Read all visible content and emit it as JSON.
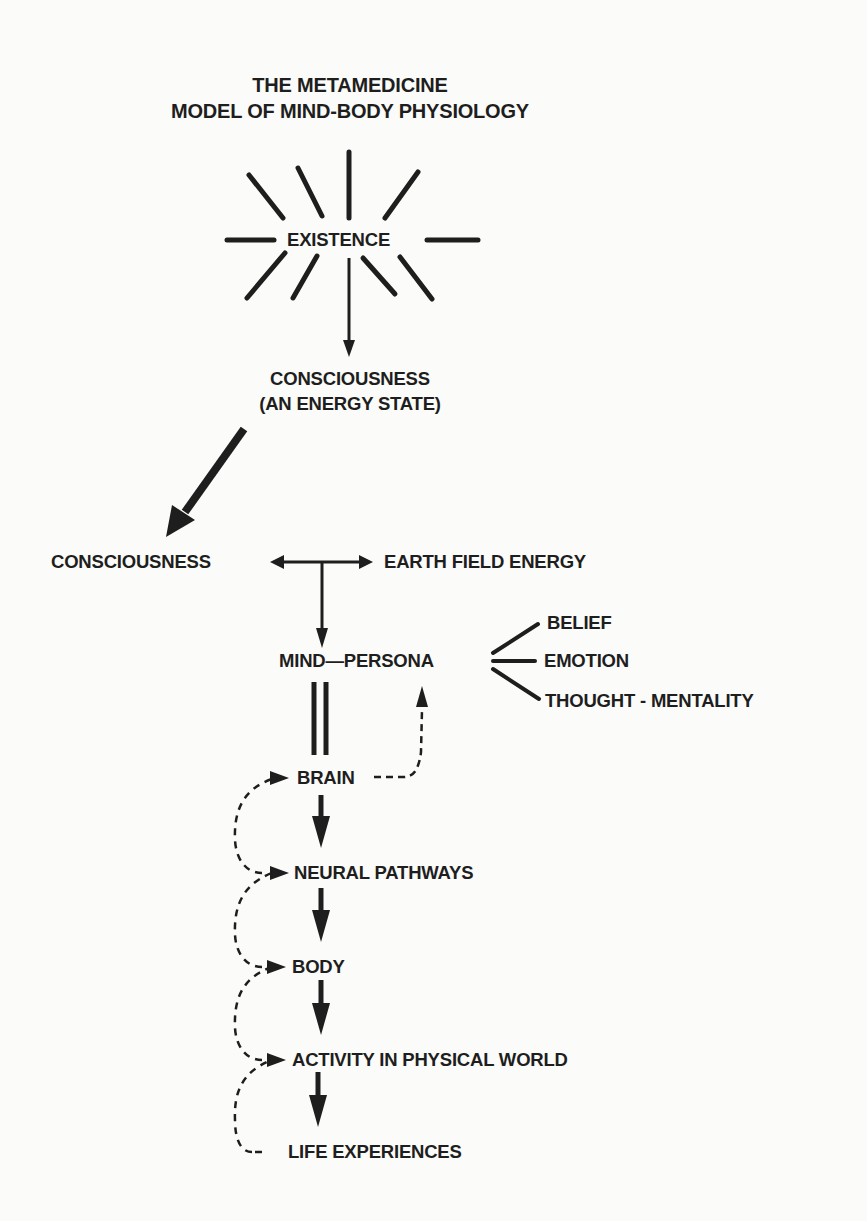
{
  "title": {
    "line1": "THE METAMEDICINE",
    "line2": "MODEL OF MIND-BODY PHYSIOLOGY"
  },
  "nodes": {
    "existence": "EXISTENCE",
    "consciousness_top_line1": "CONSCIOUSNESS",
    "consciousness_top_line2": "(AN ENERGY STATE)",
    "consciousness": "CONSCIOUSNESS",
    "earth_field_energy": "EARTH FIELD ENERGY",
    "mind_persona": "MIND—PERSONA",
    "belief": "BELIEF",
    "emotion": "EMOTION",
    "thought_mentality": "THOUGHT - MENTALITY",
    "brain": "BRAIN",
    "neural_pathways": "NEURAL PATHWAYS",
    "body": "BODY",
    "activity": "ACTIVITY IN PHYSICAL WORLD",
    "life_experiences": "LIFE EXPERIENCES"
  },
  "edges": [
    {
      "from": "existence",
      "to": "consciousness_top",
      "style": "solid-arrow"
    },
    {
      "from": "consciousness_top",
      "to": "consciousness",
      "style": "heavy-arrow"
    },
    {
      "from": "consciousness",
      "to": "earth_field_energy",
      "style": "double-headed-arrow"
    },
    {
      "from": "consciousness_earth_link",
      "to": "mind_persona",
      "style": "solid-arrow"
    },
    {
      "from": "mind_persona",
      "to": "belief",
      "style": "line"
    },
    {
      "from": "mind_persona",
      "to": "emotion",
      "style": "line"
    },
    {
      "from": "mind_persona",
      "to": "thought_mentality",
      "style": "line"
    },
    {
      "from": "mind_persona",
      "to": "brain",
      "style": "double-line"
    },
    {
      "from": "brain",
      "to": "mind_persona",
      "style": "dashed-arrow"
    },
    {
      "from": "brain",
      "to": "neural_pathways",
      "style": "heavy-arrow"
    },
    {
      "from": "neural_pathways",
      "to": "body",
      "style": "heavy-arrow"
    },
    {
      "from": "body",
      "to": "activity",
      "style": "heavy-arrow"
    },
    {
      "from": "activity",
      "to": "life_experiences",
      "style": "heavy-arrow"
    },
    {
      "from": "neural_pathways",
      "to": "brain",
      "style": "dashed-feedback-arrow"
    },
    {
      "from": "body",
      "to": "neural_pathways",
      "style": "dashed-feedback-arrow"
    },
    {
      "from": "activity",
      "to": "body",
      "style": "dashed-feedback-arrow"
    },
    {
      "from": "life_experiences",
      "to": "activity",
      "style": "dashed-feedback-arrow"
    }
  ],
  "colors": {
    "ink": "#1e1e1e",
    "paper": "#fbfbf9"
  }
}
